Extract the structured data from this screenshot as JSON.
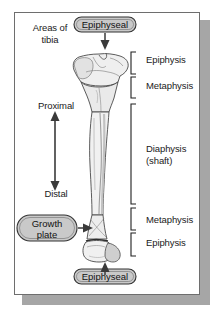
{
  "figure": {
    "title_line1": "Areas of",
    "title_line2": "tibia",
    "subject": "tibia",
    "background_color": "#ffffff",
    "frame_border_color": "#6e6e6e",
    "shadow_color": "#a6a6a6"
  },
  "orientation": {
    "proximal_label": "Proximal",
    "distal_label": "Distal",
    "arrow_name": "proximal-distal-double-arrow",
    "arrow_color": "#3a3a3a"
  },
  "callouts": [
    {
      "id": "epiphyseal-top",
      "label": "Epiphyseal",
      "position": "top",
      "arrow_direction": "down",
      "fill": "#c9c9c9",
      "border": "#333333"
    },
    {
      "id": "growth-plate",
      "label_line1": "Growth",
      "label_line2": "plate",
      "position": "left-lower",
      "arrow_direction": "right",
      "fill": "#c9c9c9",
      "border": "#333333"
    },
    {
      "id": "epiphyseal-bottom",
      "label": "Epiphyseal",
      "position": "bottom",
      "arrow_direction": "up",
      "fill": "#c9c9c9",
      "border": "#333333"
    }
  ],
  "regions": [
    {
      "id": "epiphysis-proximal",
      "label": "Epiphysis",
      "bracket": "proximal-epiphysis-bracket"
    },
    {
      "id": "metaphysis-proximal",
      "label": "Metaphysis",
      "bracket": "proximal-metaphysis-bracket"
    },
    {
      "id": "diaphysis",
      "label_line1": "Diaphysis",
      "label_line2": "(shaft)",
      "bracket": "diaphysis-bracket"
    },
    {
      "id": "metaphysis-distal",
      "label": "Metaphysis",
      "bracket": "distal-metaphysis-bracket"
    },
    {
      "id": "epiphysis-distal",
      "label": "Epiphysis",
      "bracket": "distal-epiphysis-bracket"
    }
  ],
  "bone": {
    "name": "tibia-illustration",
    "outline_color": "#4a4a4a",
    "fill_light": "#f2f2f2",
    "fill_shade": "#dcdcdc",
    "fill_mid": "#e8e8e8"
  }
}
